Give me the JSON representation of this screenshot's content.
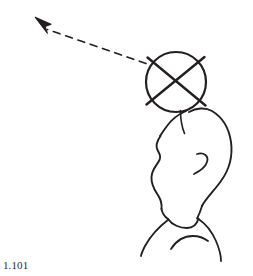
{
  "figure": {
    "caption": "1.101",
    "background_color": "#ffffff",
    "ink_color": "#231f20",
    "type": "line-art-illustration",
    "elements": {
      "pointer_arrow": {
        "name": "dashed-arrow",
        "arrowhead_tip": [
          36,
          18
        ],
        "dash_start": [
          47,
          29
        ],
        "dash_end": [
          146,
          63
        ],
        "dash_pattern": "7 6",
        "stroke_width": 1.6
      },
      "crossed_circle": {
        "name": "crossed-circle",
        "center": [
          176,
          82
        ],
        "radius": 30,
        "stroke_width": 2.2,
        "cross_overshoot": 8
      },
      "head_profile": {
        "name": "head-profile",
        "stroke_width": 1.8
      },
      "ear": {
        "name": "ear-curve",
        "stroke_width": 1.8
      },
      "neck_and_shoulders": {
        "name": "neck-shoulders",
        "stroke_width": 1.8
      },
      "collarbone": {
        "name": "collarbone-curve",
        "stroke_width": 1.8
      }
    }
  }
}
